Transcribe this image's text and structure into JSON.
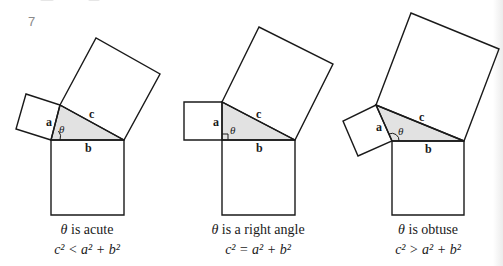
{
  "page_number": "7",
  "colors": {
    "stroke": "#1a1a1a",
    "triangle_fill": "#e2e2e2",
    "background": "#ffffff",
    "page_number": "#8a8a8a"
  },
  "labels": {
    "a": "a",
    "b": "b",
    "c": "c",
    "theta": "θ"
  },
  "figures": [
    {
      "id": "acute",
      "caption_theta": "θ",
      "caption_text": " is acute",
      "relation": "c² < a² + b²",
      "vertices": {
        "apex": [
          60,
          105
        ],
        "right_angle_corner": [
          51,
          140
        ],
        "far": [
          124,
          140
        ]
      }
    },
    {
      "id": "right",
      "caption_theta": "θ",
      "caption_text": " is a right angle",
      "relation": "c² = a² + b²",
      "vertices": {
        "apex": [
          222,
          102
        ],
        "right_angle_corner": [
          222,
          140
        ],
        "far": [
          295,
          140
        ]
      }
    },
    {
      "id": "obtuse",
      "caption_theta": "θ",
      "caption_text": " is obtuse",
      "relation": "c² > a² + b²",
      "vertices": {
        "apex": [
          376,
          105
        ],
        "right_angle_corner": [
          392,
          141
        ],
        "far": [
          464,
          141
        ]
      }
    }
  ]
}
